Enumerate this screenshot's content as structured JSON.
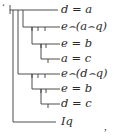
{
  "notation": "Begriffsschrift (Frege concept-script)",
  "formulas": [
    {
      "text": "d = a",
      "row": 0
    },
    {
      "text": "e⌢(a⌢q)",
      "row": 1
    },
    {
      "text": "e = b",
      "row": 2
    },
    {
      "text": "a = c",
      "row": 3
    },
    {
      "text": "e⌢(d⌢q)",
      "row": 4
    },
    {
      "text": "e = b",
      "row": 5
    },
    {
      "text": "d = c",
      "row": 6
    },
    {
      "text": "Iq",
      "row": 7
    }
  ],
  "leading_mark": "‘",
  "trailing_punct": ",",
  "colors": {
    "ink": "#2a2a2a",
    "background": "#ffffff"
  }
}
